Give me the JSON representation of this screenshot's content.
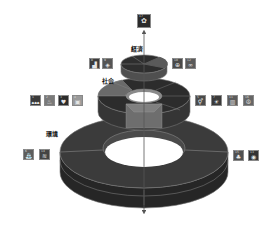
{
  "diagram": {
    "axis": {
      "direction": "vertical",
      "arrow_top": true,
      "arrow_bottom": true,
      "color": "#555555"
    },
    "top_goal": {
      "goal": 17,
      "icon": "partnership-icon",
      "glyph": "✿",
      "color": "#2a2a2a"
    },
    "layers": [
      {
        "id": "economy",
        "label": "経済",
        "shape": "disc",
        "top_color": "#3a3a3a",
        "side_color": "#4f4f4f",
        "left_icons": [
          {
            "goal": 8,
            "icon": "growth-chart-icon",
            "glyph": "▟",
            "color": "#3c3c3c"
          },
          {
            "goal": 9,
            "icon": "industry-icon",
            "glyph": "◈",
            "color": "#555555"
          }
        ],
        "right_icons": [
          {
            "goal": 10,
            "icon": "reduced-inequality-icon",
            "glyph": "⊕",
            "color": "#4a4a4a"
          },
          {
            "goal": 12,
            "icon": "infinity-icon",
            "glyph": "∞",
            "color": "#5a5a5a"
          }
        ]
      },
      {
        "id": "society",
        "label": "社会",
        "shape": "ring",
        "top_color": "#2e2e2e",
        "side_color": "#3d3d3d",
        "left_icons": [
          {
            "goal": 1,
            "icon": "no-poverty-icon",
            "glyph": "☗☗☗",
            "color": "#3a3a3a"
          },
          {
            "goal": 2,
            "icon": "zero-hunger-icon",
            "glyph": "♨",
            "color": "#7a7a7a"
          },
          {
            "goal": 3,
            "icon": "health-icon",
            "glyph": "♥",
            "color": "#2c2c2c"
          },
          {
            "goal": 4,
            "icon": "education-icon",
            "glyph": "▣",
            "color": "#9a9a9a"
          }
        ],
        "right_icons": [
          {
            "goal": 5,
            "icon": "gender-equality-icon",
            "glyph": "⚥",
            "color": "#4a4a4a"
          },
          {
            "goal": 7,
            "icon": "energy-icon",
            "glyph": "☀",
            "color": "#3a3a3a"
          },
          {
            "goal": 11,
            "icon": "cities-icon",
            "glyph": "▥",
            "color": "#5c5c5c"
          },
          {
            "goal": 16,
            "icon": "peace-icon",
            "glyph": "☮",
            "color": "#666666"
          }
        ]
      },
      {
        "id": "environment",
        "label": "環境",
        "shape": "ring",
        "top_color": "#3b3b3b",
        "side_color": "#2a2a2a",
        "left_icons": [
          {
            "goal": 6,
            "icon": "clean-water-icon",
            "glyph": "⛲",
            "color": "#5d5d5d"
          },
          {
            "goal": 14,
            "icon": "life-below-water-icon",
            "glyph": "≋",
            "color": "#444444"
          }
        ],
        "right_icons": [
          {
            "goal": 15,
            "icon": "life-on-land-icon",
            "glyph": "♣",
            "color": "#505050"
          },
          {
            "goal": 13,
            "icon": "climate-action-icon",
            "glyph": "◉",
            "color": "#333333"
          }
        ]
      }
    ]
  }
}
